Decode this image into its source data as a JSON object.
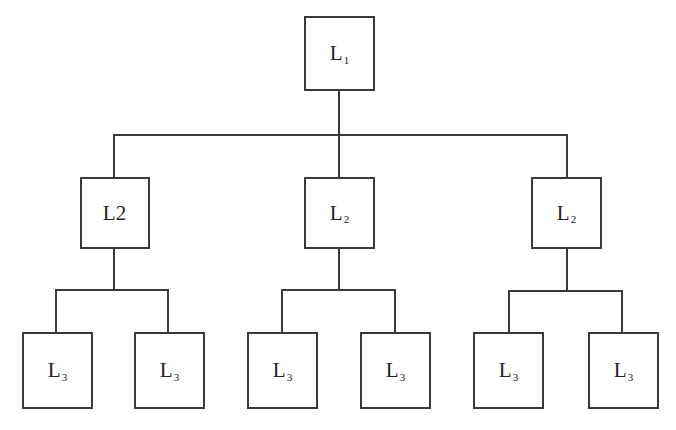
{
  "diagram": {
    "type": "hierarchy-tree",
    "colors": {
      "stroke": "#3a3a3a",
      "text": "#222222",
      "background": "#ffffff"
    },
    "root": {
      "label": "L",
      "sub": "1"
    },
    "level2": [
      {
        "label": "L2",
        "sub": ""
      },
      {
        "label": "L",
        "sub": "2"
      },
      {
        "label": "L",
        "sub": "2"
      }
    ],
    "level3": [
      {
        "label": "L",
        "sub": "3"
      },
      {
        "label": "L",
        "sub": "3"
      },
      {
        "label": "L",
        "sub": "3"
      },
      {
        "label": "L",
        "sub": "3"
      },
      {
        "label": "L",
        "sub": "3"
      },
      {
        "label": "L",
        "sub": "3"
      }
    ]
  }
}
